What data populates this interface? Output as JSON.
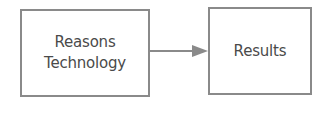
{
  "diagram": {
    "nodes": [
      {
        "id": "reasons",
        "lines": [
          "Reasons",
          "Technology"
        ]
      },
      {
        "id": "results",
        "lines": [
          "Results"
        ]
      }
    ],
    "edges": [
      {
        "from": "reasons",
        "to": "results",
        "type": "arrow"
      }
    ],
    "colors": {
      "border": "#8a8a8a",
      "text": "#4a4a4a",
      "arrow": "#8a8a8a"
    }
  }
}
